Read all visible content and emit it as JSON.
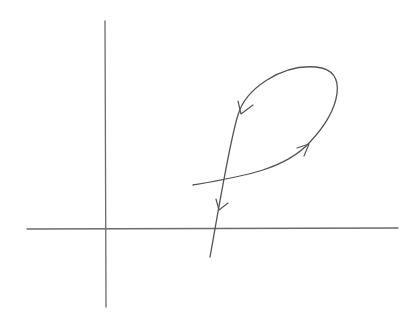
{
  "diagram": {
    "type": "phase-portrait-sketch",
    "colors": {
      "background": "#ffffff",
      "axis": "#6b6b6b",
      "curve": "#555555"
    },
    "axes": {
      "horizontal": {
        "x1": 27,
        "y1": 229,
        "x2": 398,
        "y2": 228
      },
      "vertical": {
        "x1": 105,
        "y1": 21,
        "x2": 106,
        "y2": 307
      }
    },
    "curve": {
      "path": "M 193 185 C 240 177, 285 170, 310 142 C 340 110, 350 70, 316 67 C 280 64, 245 90, 238 115 C 230 140, 222 190, 210 257",
      "arrows": [
        {
          "name": "arrow-right",
          "tip": [
            309,
            144
          ],
          "direction": "up-right"
        },
        {
          "name": "arrow-upper-left",
          "tip": [
            240,
            114
          ],
          "direction": "down-left"
        },
        {
          "name": "arrow-lower",
          "tip": [
            219,
            210
          ],
          "direction": "down"
        }
      ]
    },
    "labels": []
  }
}
